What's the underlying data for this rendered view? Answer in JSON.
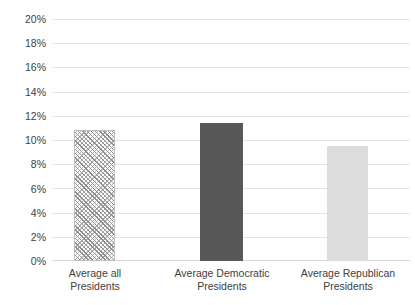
{
  "chart_data": {
    "type": "bar",
    "title": "",
    "subtitle": "",
    "xlabel": "",
    "ylabel": "",
    "categories": [
      "Average all Presidents",
      "Average Democratic Presidents",
      "Average Republican Presidents"
    ],
    "category_lines": [
      [
        "Average all",
        "Presidents"
      ],
      [
        "Average Democratic",
        "Presidents"
      ],
      [
        "Average Republican",
        "Presidents"
      ]
    ],
    "values": [
      10.8,
      11.4,
      9.5
    ],
    "value_labels": [
      "10.8%",
      "11.4%",
      "9.5%"
    ],
    "ylim": [
      0,
      20
    ],
    "ytick_step": 2,
    "ytick_labels": [
      "20%",
      "18%",
      "16%",
      "14%",
      "12%",
      "10%",
      "8%",
      "6%",
      "4%",
      "2%",
      "0%"
    ],
    "ytick_values": [
      20,
      18,
      16,
      14,
      12,
      10,
      8,
      6,
      4,
      2,
      0
    ],
    "grid": true,
    "grid_axis": "y",
    "legend": false,
    "legend_position": "none",
    "annotations": [],
    "bar_styles": [
      {
        "name": "hatched-gray",
        "fill": "#ffffff",
        "hatch": "crosshatch",
        "hatch_color": "#8e8e8e",
        "border": "#bdbdbd"
      },
      {
        "name": "solid-dark-gray",
        "fill": "#585858",
        "hatch": "none",
        "border": "#585858"
      },
      {
        "name": "solid-light-gray",
        "fill": "#dcdcdc",
        "hatch": "none",
        "border": "#dcdcdc"
      }
    ],
    "colors": {
      "background": "#ffffff",
      "gridline": "#e4e4e4",
      "baseline": "#d8d8d8",
      "text": "#404040"
    }
  }
}
